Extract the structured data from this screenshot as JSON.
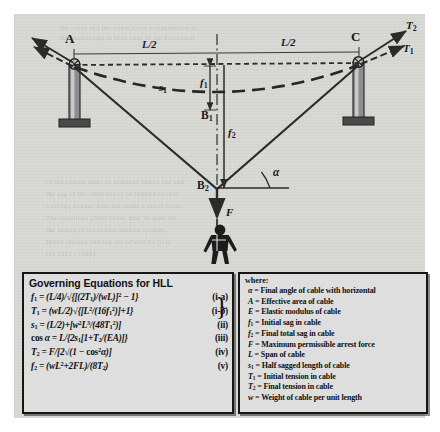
{
  "diagram": {
    "labels": {
      "support_left": "A",
      "support_right": "C",
      "span_left": "L/2",
      "span_right": "L/2",
      "sagged_half_length": "s",
      "sagged_half_length_sub": "1",
      "initial_sag": "f",
      "initial_sag_sub": "1",
      "final_sag": "f",
      "final_sag_sub": "2",
      "midpoint_initial": "B",
      "midpoint_initial_sub": "1",
      "midpoint_final": "B",
      "midpoint_final_sub": "2",
      "force": "F",
      "angle": "α",
      "tension_initial": "T",
      "tension_initial_sub": "1",
      "tension_final": "T",
      "tension_final_sub": "2"
    },
    "figure_alt": "worker suspended in fall-arrest harness"
  },
  "equations_box": {
    "title": "Governing Equations for HLL",
    "rows": [
      {
        "number": "(i-a)"
      },
      {
        "number": "(i-b)"
      },
      {
        "number": "(ii)"
      },
      {
        "number": "(iii)"
      },
      {
        "number": "(iv)"
      },
      {
        "number": "(v)"
      }
    ],
    "plain_text": [
      "f1 = (L/4)/√{[(2T1)/(wL)]² − 1}",
      "T1 = (wL/2)√{[L²/(16f1²)]+1}",
      "s1 = (L/2)+[w²L³/(48T1²)]",
      "cos α = L/{2s1[1+T2/(EA)]}",
      "T2 = F/[2√(1 − cos²α)]",
      "f2 = (wL²+2FL)/(8T2)"
    ]
  },
  "legend_box": {
    "title": "where:",
    "items": [
      {
        "symbol": "α",
        "sub": "",
        "definition": "Final angle of cable with horizontal"
      },
      {
        "symbol": "A",
        "sub": "",
        "definition": "Effective area of cable"
      },
      {
        "symbol": "E",
        "sub": "",
        "definition": "Elastic modulus of cable"
      },
      {
        "symbol": "f",
        "sub": "1",
        "definition": "Initial sag in cable"
      },
      {
        "symbol": "f",
        "sub": "2",
        "definition": "Final total sag in cable"
      },
      {
        "symbol": "F",
        "sub": "",
        "definition": "Maximum permissible arrest force"
      },
      {
        "symbol": "L",
        "sub": "",
        "definition": "Span of cable"
      },
      {
        "symbol": "s",
        "sub": "1",
        "definition": "Half sagged length of cable"
      },
      {
        "symbol": "T",
        "sub": "1",
        "definition": "Initial tension in cable"
      },
      {
        "symbol": "T",
        "sub": "2",
        "definition": "Final tension in cable"
      },
      {
        "symbol": "w",
        "sub": "",
        "definition": "Weight of cable per unit length"
      }
    ]
  },
  "colors": {
    "paper": "#d9d9d6",
    "box_fill": "#dedede",
    "ink": "#1a1a1a",
    "border": "#161616"
  }
}
